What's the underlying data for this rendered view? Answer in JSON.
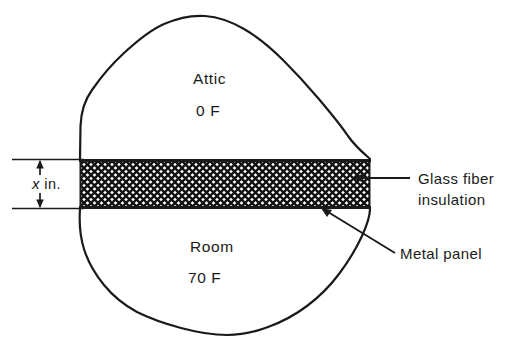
{
  "figure": {
    "name": "attic-room-insulated-ceiling-section",
    "background_color": "#ffffff",
    "line_color": "#1a1a1a",
    "text_color": "#1a1a1a"
  },
  "zones": {
    "upper": {
      "name_label": "Attic",
      "temperature_label": "0 F"
    },
    "lower": {
      "name_label": "Room",
      "temperature_label": "70 F"
    }
  },
  "layer": {
    "hatch_pattern": "cross-hatch",
    "top_edge_y": 159,
    "bottom_edge_y": 209
  },
  "dimension": {
    "symbol": "x",
    "unit_label": " in.",
    "full_label": "x in.",
    "arrow_style": "double-headed-outward"
  },
  "callouts": [
    {
      "id": "glass-fiber-insulation",
      "line1": "Glass fiber",
      "line2": "insulation",
      "leader": "horizontal"
    },
    {
      "id": "metal-panel",
      "line1": "Metal panel",
      "line2": "",
      "leader": "diagonal"
    }
  ]
}
